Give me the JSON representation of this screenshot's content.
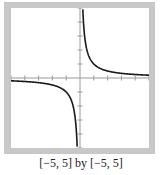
{
  "caption": "[−5, 5] by [−5, 5]",
  "colors": {
    "frame": "#c8c8c8",
    "curve": "#1a1a1a",
    "axis": "#9a9a9a"
  },
  "chart_data": {
    "type": "line",
    "title": "",
    "function": "y = 1/x",
    "xlabel": "",
    "ylabel": "",
    "xlim": [
      -5,
      5
    ],
    "ylim": [
      -5,
      5
    ],
    "grid": false,
    "x_ticks": [
      -5,
      -4,
      -3,
      -2,
      -1,
      1,
      2,
      3,
      4,
      5
    ],
    "y_ticks": [
      -5,
      -4,
      -3,
      -2,
      -1,
      1,
      2,
      3,
      4,
      5
    ],
    "series": [
      {
        "name": "y=1/x (x<0)",
        "x": [
          -5,
          -4,
          -3,
          -2,
          -1.5,
          -1,
          -0.6,
          -0.4,
          -0.3,
          -0.2
        ],
        "y": [
          -0.2,
          -0.25,
          -0.333,
          -0.5,
          -0.667,
          -1,
          -1.667,
          -2.5,
          -3.333,
          -5
        ]
      },
      {
        "name": "y=1/x (x>0)",
        "x": [
          0.2,
          0.3,
          0.4,
          0.6,
          1,
          1.5,
          2,
          3,
          4,
          5
        ],
        "y": [
          5,
          3.333,
          2.5,
          1.667,
          1,
          0.667,
          0.5,
          0.333,
          0.25,
          0.2
        ]
      }
    ],
    "annotations": [
      "[−5, 5] by [−5, 5]"
    ]
  }
}
